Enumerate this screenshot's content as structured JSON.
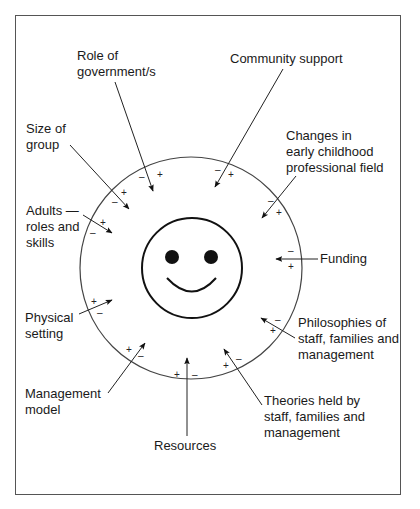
{
  "diagram": {
    "type": "influence-diagram",
    "center": {
      "icon": "smiley-face",
      "description": "Child / early childhood service at centre"
    },
    "boundary": "circle",
    "sign_legend": {
      "positive": "+",
      "negative": "–"
    },
    "factors": [
      {
        "id": "role-of-government",
        "lines": [
          "Role of",
          "government/s"
        ]
      },
      {
        "id": "community-support",
        "lines": [
          "Community support"
        ]
      },
      {
        "id": "size-of-group",
        "lines": [
          "Size of",
          "group"
        ]
      },
      {
        "id": "changes-ec-field",
        "lines": [
          "Changes in",
          "early childhood",
          "professional field"
        ]
      },
      {
        "id": "adults-roles",
        "lines": [
          "Adults —",
          "roles and",
          "skills"
        ]
      },
      {
        "id": "funding",
        "lines": [
          "Funding"
        ]
      },
      {
        "id": "physical-setting",
        "lines": [
          "Physical",
          "setting"
        ]
      },
      {
        "id": "philosophies",
        "lines": [
          "Philosophies of",
          "staff, families and",
          "management"
        ]
      },
      {
        "id": "management-model",
        "lines": [
          "Management",
          "model"
        ]
      },
      {
        "id": "theories",
        "lines": [
          "Theories held by",
          "staff, families and",
          "management"
        ]
      },
      {
        "id": "resources",
        "lines": [
          "Resources"
        ]
      }
    ]
  }
}
